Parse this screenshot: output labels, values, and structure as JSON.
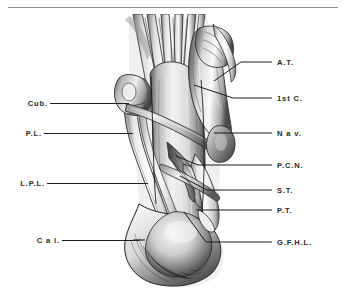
{
  "figure": {
    "kind": "anatomical-illustration",
    "background_color": "#ffffff",
    "ink_color": "#1d1d1d",
    "rule_color": "#8d8d8d"
  },
  "rule": {
    "name": "top-horizontal-rule",
    "x": 8,
    "y": 7,
    "width": 330
  },
  "labels": {
    "left": [
      {
        "id": "cub",
        "text": "Cub.",
        "text_x": 22,
        "text_y": 99,
        "line_x1": 50,
        "line_y1": 103,
        "line_x2": 129,
        "line_y2": 103
      },
      {
        "id": "pl",
        "text": "P.L.",
        "text_x": 18,
        "text_y": 129,
        "line_x1": 44,
        "line_y1": 133,
        "line_x2": 133,
        "line_y2": 133
      },
      {
        "id": "lpl",
        "text": "L.P.L.",
        "text_x": 12,
        "text_y": 179,
        "line_x1": 47,
        "line_y1": 183,
        "line_x2": 148,
        "line_y2": 183
      },
      {
        "id": "cal",
        "text": "C a l.",
        "text_x": 30,
        "text_y": 236,
        "line_x1": 62,
        "line_y1": 240,
        "line_x2": 139,
        "line_y2": 240
      }
    ],
    "right": [
      {
        "id": "at",
        "text": "A.T.",
        "text_x": 277,
        "text_y": 58,
        "line_x1": 272,
        "line_y1": 62,
        "line_x2": 240,
        "line_y2": 62,
        "line_x3": 215,
        "line_y3": 80
      },
      {
        "id": "1stc",
        "text": "1st C.",
        "text_x": 277,
        "text_y": 94,
        "line_x1": 272,
        "line_y1": 98,
        "line_x2": 232,
        "line_y2": 98,
        "line_x3": 193,
        "line_y3": 86
      },
      {
        "id": "nav",
        "text": "N a v.",
        "text_x": 277,
        "text_y": 129,
        "line_x1": 272,
        "line_y1": 133,
        "line_x2": 215,
        "line_y2": 133,
        "line_x3": 215,
        "line_y3": 133
      },
      {
        "id": "pcn",
        "text": "P.C.N.",
        "text_x": 277,
        "text_y": 161,
        "line_x1": 272,
        "line_y1": 165,
        "line_x2": 196,
        "line_y2": 165,
        "line_x3": 177,
        "line_y3": 156
      },
      {
        "id": "st",
        "text": "S.T.",
        "text_x": 277,
        "text_y": 186,
        "line_x1": 272,
        "line_y1": 190,
        "line_x2": 205,
        "line_y2": 190,
        "line_x3": 180,
        "line_y3": 178
      },
      {
        "id": "pt",
        "text": "P.T.",
        "text_x": 277,
        "text_y": 206,
        "line_x1": 272,
        "line_y1": 210,
        "line_x2": 197,
        "line_y2": 210,
        "line_x3": 197,
        "line_y3": 210
      },
      {
        "id": "gfhl",
        "text": "G.F.H.L.",
        "text_x": 277,
        "text_y": 238,
        "line_x1": 272,
        "line_y1": 242,
        "line_x2": 205,
        "line_y2": 242,
        "line_x3": 184,
        "line_y3": 213
      }
    ]
  },
  "legend_expansions": {
    "cub": "Cuboid",
    "pl": "Peroneus Longus",
    "lpl": "Long Plantar Ligament",
    "cal": "Calcaneus",
    "at": "Adductor Tendon",
    "1stc": "1st Cuneiform",
    "nav": "Navicular",
    "pcn": "Plantar Calcaneonavicular",
    "st": "Sustentaculum Tali",
    "pt": "Posterior Tibial",
    "gfhl": "Groove for Flexor Hallucis Longus"
  }
}
